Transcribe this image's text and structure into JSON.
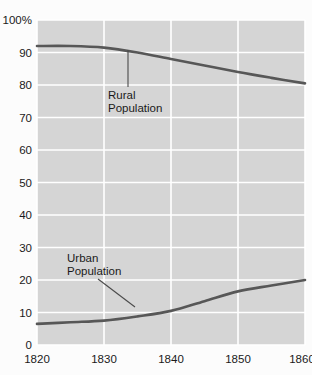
{
  "chart_data": {
    "type": "line",
    "title": "",
    "subtitle": "",
    "xlabel": "",
    "ylabel": "",
    "xlim": [
      1820,
      1860
    ],
    "ylim": [
      0,
      100
    ],
    "grid": true,
    "legend_position": "inline-annotations",
    "x_tick_labels": [
      "1820",
      "1830",
      "1840",
      "1850",
      "1860"
    ],
    "x_ticks": [
      1820,
      1830,
      1840,
      1850,
      1860
    ],
    "y_tick_labels": [
      "100%",
      "90",
      "80",
      "70",
      "60",
      "50",
      "40",
      "30",
      "20",
      "10",
      "0"
    ],
    "y_ticks": [
      100,
      90,
      80,
      70,
      60,
      50,
      40,
      30,
      20,
      10,
      0
    ],
    "x": [
      1820,
      1825,
      1830,
      1835,
      1840,
      1845,
      1850,
      1855,
      1860
    ],
    "series": [
      {
        "name": "Rural Population",
        "color": "#575757",
        "values": [
          92.0,
          92.0,
          91.5,
          90.0,
          88.0,
          86.0,
          84.0,
          82.2,
          80.5
        ]
      },
      {
        "name": "Urban Population",
        "color": "#575757",
        "values": [
          6.5,
          7.0,
          7.5,
          8.8,
          10.5,
          13.5,
          16.5,
          18.3,
          20.0
        ]
      }
    ],
    "annotations": [
      {
        "text_line1": "Rural",
        "text_line2": "Population",
        "target_year": 1834,
        "target_value": 90.5
      },
      {
        "text_line1": "Urban",
        "text_line2": "Population",
        "target_year": 1835,
        "target_value": 10.5
      }
    ],
    "colors": {
      "plot_background": "#d5d5d5",
      "page_background": "#fcfcfc",
      "gridline": "#ffffff",
      "line": "#575757",
      "text": "#1a1a1a",
      "leader_line": "#4a4a4a"
    }
  },
  "axis": {
    "y_top_label": "100%",
    "y_labels": [
      "90",
      "80",
      "70",
      "60",
      "50",
      "40",
      "30",
      "20",
      "10",
      "0"
    ],
    "x_labels": [
      "1820",
      "1830",
      "1840",
      "1850",
      "1860"
    ]
  },
  "annotations": {
    "rural": {
      "line1": "Rural",
      "line2": "Population"
    },
    "urban": {
      "line1": "Urban",
      "line2": "Population"
    }
  }
}
